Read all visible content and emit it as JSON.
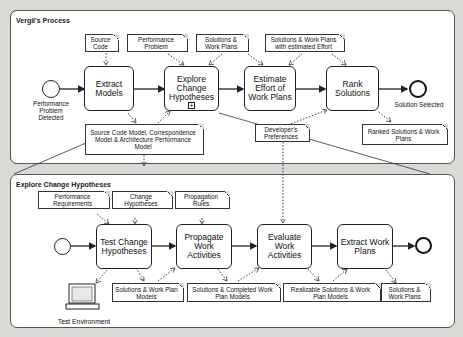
{
  "top_pool": {
    "title": "Vergil's Process",
    "start_event": "Performance Problem Detected",
    "end_event": "Solution Selected",
    "tasks": [
      "Extract Models",
      "Explore Change Hypotheses",
      "Estimate Effort of Work Plans",
      "Rank Solutions"
    ],
    "documents": {
      "source_code": "Source Code",
      "performance_problem": "Performance Problem",
      "solutions_work_plans": "Solutions & Work Plans",
      "solutions_estimated": "Solutions & Work Plans with estimated Effort",
      "models": "Source Code Model, Correspondence Model & Architecture Performance Model",
      "developer_preferences": "Developer's Preferences",
      "ranked_solutions": "Ranked Solutions & Work Plans"
    }
  },
  "bottom_pool": {
    "title": "Explore Change Hypotheses",
    "tasks": [
      "Test Change Hypotheses",
      "Propagate Work Activities",
      "Evaluate Work Activities",
      "Extract Work Plans"
    ],
    "documents": {
      "performance_requirements": "Performance Requirements",
      "change_hypotheses": "Change Hypotheses",
      "propagation_rules": "Propagation Rules",
      "solutions_models": "Solutions & Work Plan Models",
      "solutions_completed": "Solutions & Completed Work Plan Models",
      "realizable_solutions": "Realizable Solutions & Work Plan Models",
      "solutions_work_plans": "Solutions & Work Plans"
    },
    "test_environment": "Test Environment"
  }
}
